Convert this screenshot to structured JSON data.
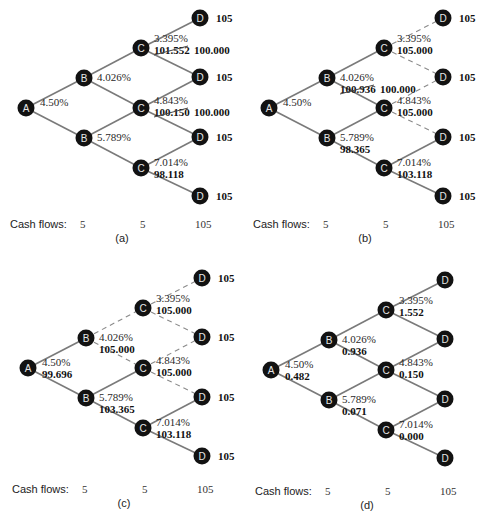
{
  "figure": {
    "cash_flows_label": "Cash flows:",
    "cash_flows": [
      "5",
      "5",
      "105"
    ],
    "terminal_value": "105",
    "node_letters": {
      "A": "A",
      "B": "B",
      "C": "C",
      "D": "D"
    },
    "colors": {
      "node": "#121212",
      "edge": "#7a7a7a",
      "node_text": "#e6e6e6"
    }
  },
  "panels": [
    {
      "id": "a",
      "label": "(a)",
      "rates": {
        "A": "4.50%",
        "B_up": "4.026%",
        "B_down": "5.789%",
        "C_up": "3.395%",
        "C_mid": "4.843%",
        "C_down": "7.014%"
      },
      "values": {
        "A": "",
        "B_up": "",
        "B_down": "",
        "C_up": "101.552",
        "C_mid": "100.150",
        "C_down": "98.118"
      },
      "struck": {
        "C_up": true,
        "C_mid": true
      },
      "replacement": {
        "C_up": "100.000",
        "C_mid": "100.000"
      },
      "show_terminal": true,
      "dashed_edges": []
    },
    {
      "id": "b",
      "label": "(b)",
      "rates": {
        "A": "4.50%",
        "B_up": "4.026%",
        "B_down": "5.789%",
        "C_up": "3.395%",
        "C_mid": "4.843%",
        "C_down": "7.014%"
      },
      "values": {
        "A": "",
        "B_up": "100.936",
        "B_down": "98.365",
        "C_up": "105.000",
        "C_mid": "105.000",
        "C_down": "103.118"
      },
      "struck": {
        "B_up": true
      },
      "replacement": {
        "B_up": "100.000"
      },
      "show_terminal": true,
      "dashed_edges": [
        "Cu-D1",
        "Cu-D2",
        "Cm-D2",
        "Cm-D3"
      ]
    },
    {
      "id": "c",
      "label": "(c)",
      "rates": {
        "A": "4.50%",
        "B_up": "4.026%",
        "B_down": "5.789%",
        "C_up": "3.395%",
        "C_mid": "4.843%",
        "C_down": "7.014%"
      },
      "values": {
        "A": "99.696",
        "B_up": "105.000",
        "B_down": "103.365",
        "C_up": "105.000",
        "C_mid": "105.000",
        "C_down": "103.118"
      },
      "struck": {},
      "replacement": {},
      "show_terminal": true,
      "dashed_edges": [
        "Bu-Cu",
        "Bu-Cm",
        "Cu-D1",
        "Cu-D2",
        "Cm-D2",
        "Cm-D3"
      ]
    },
    {
      "id": "d",
      "label": "(d)",
      "rates": {
        "A": "4.50%",
        "B_up": "4.026%",
        "B_down": "5.789%",
        "C_up": "3.395%",
        "C_mid": "4.843%",
        "C_down": "7.014%"
      },
      "values": {
        "A": "0.482",
        "B_up": "0.936",
        "B_down": "0.071",
        "C_up": "1.552",
        "C_mid": "0.150",
        "C_down": "0.000"
      },
      "struck": {},
      "replacement": {},
      "show_terminal": false,
      "dashed_edges": []
    }
  ]
}
